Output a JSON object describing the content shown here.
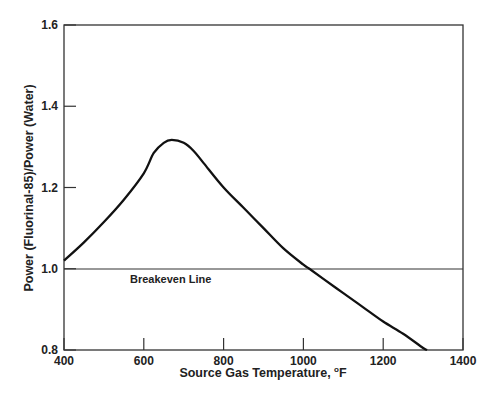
{
  "chart_data": {
    "type": "line",
    "title": "",
    "xlabel": "Source Gas Temperature, °F",
    "xlabel_main": "Source Gas Temperature, ",
    "xlabel_unit_sup": "o",
    "xlabel_unit": "F",
    "ylabel": "Power (Fluorinal-85)/Power (Water)",
    "xlim": [
      400,
      1400
    ],
    "ylim": [
      0.8,
      1.6
    ],
    "x_ticks": [
      "400",
      "600",
      "800",
      "1000",
      "1200",
      "1400"
    ],
    "y_ticks": [
      "0.8",
      "1.0",
      "1.2",
      "1.4",
      "1.6"
    ],
    "grid": false,
    "annotations": [
      {
        "text": "Breakeven Line",
        "y": 1.0
      }
    ],
    "series": [
      {
        "name": "Power ratio",
        "x": [
          400,
          450,
          500,
          550,
          600,
          625,
          650,
          670,
          700,
          725,
          750,
          800,
          850,
          900,
          950,
          1000,
          1015,
          1050,
          1100,
          1150,
          1200,
          1250,
          1300,
          1310
        ],
        "values": [
          1.02,
          1.065,
          1.115,
          1.17,
          1.235,
          1.285,
          1.31,
          1.317,
          1.31,
          1.29,
          1.26,
          1.2,
          1.15,
          1.1,
          1.05,
          1.01,
          1.0,
          0.975,
          0.94,
          0.905,
          0.87,
          0.84,
          0.805,
          0.8
        ]
      },
      {
        "name": "Breakeven Line",
        "x": [
          400,
          1400
        ],
        "values": [
          1.0,
          1.0
        ]
      }
    ]
  }
}
